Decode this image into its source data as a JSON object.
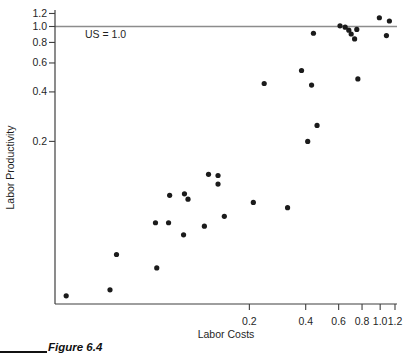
{
  "figure": {
    "caption": "Figure 6.4"
  },
  "colors": {
    "background": "#ffffff",
    "axis": "#3f3f3f",
    "tick": "#3f3f3f",
    "point": "#1b1b1b",
    "reference_line": "#8c8c8c",
    "text": "#1f1f1f",
    "caption": "#111111"
  },
  "chart_data": {
    "type": "scatter",
    "title": "",
    "xlabel": "Labor Costs",
    "ylabel": "Labor Productivity",
    "x_scale": "log",
    "y_scale": "log",
    "xlim": [
      0.0183,
      1.23
    ],
    "ylim": [
      0.0205,
      1.26
    ],
    "grid": false,
    "legend": "none",
    "x_ticks": [
      0.2,
      0.4,
      0.6,
      0.8,
      1.0,
      1.2
    ],
    "x_tick_labels": [
      "0.2",
      "0.4",
      "0.6",
      "0.8",
      "1.0",
      "1.2"
    ],
    "y_ticks": [
      1.2,
      1.0,
      0.8,
      0.6,
      0.4,
      0.2
    ],
    "y_tick_labels": [
      "1.2",
      "1.0",
      "0.8",
      "0.6",
      "0.4",
      "0.2"
    ],
    "reference_line": {
      "y": 1.0,
      "label": "US = 1.0"
    },
    "points": [
      [
        0.44,
        0.91
      ],
      [
        0.61,
        1.01
      ],
      [
        0.65,
        0.99
      ],
      [
        0.68,
        0.95
      ],
      [
        0.7,
        0.9
      ],
      [
        0.75,
        0.96
      ],
      [
        0.73,
        0.84
      ],
      [
        0.99,
        1.13
      ],
      [
        1.12,
        1.08
      ],
      [
        1.08,
        0.88
      ],
      [
        0.38,
        0.54
      ],
      [
        0.43,
        0.44
      ],
      [
        0.76,
        0.48
      ],
      [
        0.24,
        0.45
      ],
      [
        0.46,
        0.25
      ],
      [
        0.41,
        0.2
      ],
      [
        0.32,
        0.079
      ],
      [
        0.21,
        0.085
      ],
      [
        0.147,
        0.07
      ],
      [
        0.121,
        0.126
      ],
      [
        0.136,
        0.124
      ],
      [
        0.136,
        0.11
      ],
      [
        0.075,
        0.094
      ],
      [
        0.09,
        0.096
      ],
      [
        0.094,
        0.089
      ],
      [
        0.063,
        0.064
      ],
      [
        0.074,
        0.064
      ],
      [
        0.115,
        0.061
      ],
      [
        0.089,
        0.054
      ],
      [
        0.064,
        0.034
      ],
      [
        0.039,
        0.041
      ],
      [
        0.036,
        0.025
      ],
      [
        0.021,
        0.023
      ]
    ]
  }
}
